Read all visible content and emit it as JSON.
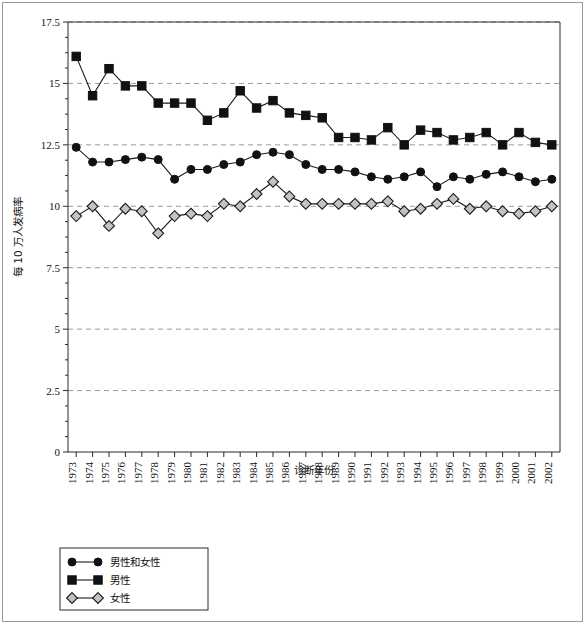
{
  "figure": {
    "background_color": "#ffffff",
    "border_color": "#9a9a9a"
  },
  "chart_data": {
    "type": "line",
    "title": "",
    "xlabel": "诊断年份",
    "ylabel": "每 10 万人发病率",
    "x": [
      1973,
      1974,
      1975,
      1976,
      1977,
      1978,
      1979,
      1980,
      1981,
      1982,
      1983,
      1984,
      1985,
      1986,
      1987,
      1988,
      1989,
      1990,
      1991,
      1992,
      1993,
      1994,
      1995,
      1996,
      1997,
      1998,
      1999,
      2000,
      2001,
      2002
    ],
    "xtick_labels": [
      "1973",
      "1974",
      "1975",
      "1976",
      "1977",
      "1978",
      "1979",
      "1980",
      "1981",
      "1982",
      "1983",
      "1984",
      "1985",
      "1986",
      "1987",
      "1988",
      "1989",
      "1990",
      "1991",
      "1992",
      "1993",
      "1994",
      "1995",
      "1996",
      "1997",
      "1998",
      "1999",
      "2000",
      "2001",
      "2002"
    ],
    "ytick_labels": [
      "0",
      "2.5",
      "5",
      "7.5",
      "10",
      "12.5",
      "15",
      "17.5"
    ],
    "yticks": [
      0,
      2.5,
      5,
      7.5,
      10,
      12.5,
      15,
      17.5
    ],
    "ylim": [
      0,
      17.5
    ],
    "grid": true,
    "grid_axis": "y",
    "legend_position": "below-left",
    "series": [
      {
        "name": "男性和女性",
        "marker": "circle",
        "marker_fill": "#111111",
        "line_color": "#1a1a1a",
        "values": [
          12.4,
          11.8,
          11.8,
          11.9,
          12.0,
          11.9,
          11.1,
          11.5,
          11.5,
          11.7,
          11.8,
          12.1,
          12.2,
          12.1,
          11.7,
          11.5,
          11.5,
          11.4,
          11.2,
          11.1,
          11.2,
          11.4,
          10.8,
          11.2,
          11.1,
          11.3,
          11.4,
          11.2,
          11.0,
          11.1
        ]
      },
      {
        "name": "男性",
        "marker": "square",
        "marker_fill": "#111111",
        "line_color": "#1a1a1a",
        "values": [
          16.1,
          14.5,
          15.6,
          14.9,
          14.9,
          14.2,
          14.2,
          14.2,
          13.5,
          13.8,
          14.7,
          14.0,
          14.3,
          13.8,
          13.7,
          13.6,
          12.8,
          12.8,
          12.7,
          13.2,
          12.5,
          13.1,
          13.0,
          12.7,
          12.8,
          13.0,
          12.5,
          13.0,
          12.6,
          12.5
        ]
      },
      {
        "name": "女性",
        "marker": "diamond",
        "marker_fill": "#c3c3c3",
        "line_color": "#1a1a1a",
        "values": [
          9.6,
          10.0,
          9.2,
          9.9,
          9.8,
          8.9,
          9.6,
          9.7,
          9.6,
          10.1,
          10.0,
          10.5,
          11.0,
          10.4,
          10.1,
          10.1,
          10.1,
          10.1,
          10.1,
          10.2,
          9.8,
          9.9,
          10.1,
          10.3,
          9.9,
          10.0,
          9.8,
          9.7,
          9.8,
          10.0
        ]
      }
    ]
  }
}
